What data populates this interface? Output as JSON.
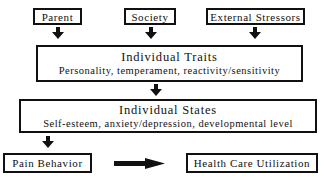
{
  "diagram": {
    "sources": [
      {
        "label": "Parent"
      },
      {
        "label": "Society"
      },
      {
        "label": "External Stressors"
      }
    ],
    "traits": {
      "title": "Individual Traits",
      "subtitle": "Personality, temperament, reactivity/sensitivity"
    },
    "states": {
      "title": "Individual States",
      "subtitle": "Self-esteem,  anxiety/depression, developmental level"
    },
    "outcomes": [
      {
        "label": "Pain Behavior"
      },
      {
        "label": "Health Care Utilization"
      }
    ],
    "colors": {
      "stroke": "#111111",
      "background": "#ffffff"
    }
  }
}
